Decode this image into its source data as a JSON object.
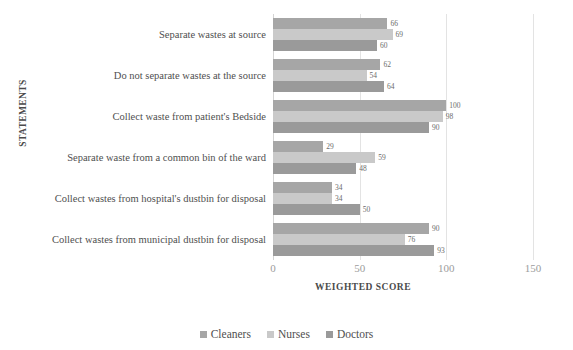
{
  "chart_data": {
    "type": "bar",
    "orientation": "horizontal",
    "title": "",
    "xlabel": "WEIGHTED SCORE",
    "ylabel": "STATEMENTS",
    "xlim": [
      0,
      150
    ],
    "xticks": [
      0,
      50,
      100,
      150
    ],
    "xtick_labels": [
      "0",
      "50",
      "100",
      "150"
    ],
    "grid": true,
    "grid_axis": "x",
    "legend_position": "bottom",
    "categories": [
      "Separate wastes at source",
      "Do not separate wastes at the source",
      "Collect waste from patient's Bedside",
      "Separate waste from a common bin of the ward",
      "Collect wastes from hospital's dustbin for disposal",
      "Collect wastes from municipal dustbin for disposal"
    ],
    "series": [
      {
        "name": "Cleaners",
        "color": "#a6a6a6",
        "values": [
          66,
          62,
          100,
          29,
          34,
          90
        ]
      },
      {
        "name": "Nurses",
        "color": "#c9c9c9",
        "values": [
          69,
          54,
          98,
          59,
          34,
          76
        ]
      },
      {
        "name": "Doctors",
        "color": "#9a9a9a",
        "values": [
          60,
          64,
          90,
          48,
          50,
          93
        ]
      }
    ]
  }
}
